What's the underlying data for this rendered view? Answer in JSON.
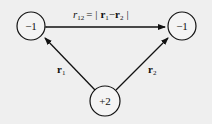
{
  "diagram": {
    "nodes": [
      {
        "id": "left",
        "label": "−1"
      },
      {
        "id": "right",
        "label": "−1"
      },
      {
        "id": "bottom",
        "label": "+2"
      }
    ],
    "edges": {
      "top": {
        "label_r": "r",
        "label_sub": "12",
        "label_eq": "= |",
        "label_r1": "r",
        "label_r1_sub": "1",
        "label_minus": "−",
        "label_r2": "r",
        "label_r2_sub": "2",
        "label_end": "|"
      },
      "left": {
        "label": "r",
        "sub": "1"
      },
      "right": {
        "label": "r",
        "sub": "2"
      }
    },
    "colors": {
      "background": "#efefef",
      "stroke": "#111111"
    }
  }
}
